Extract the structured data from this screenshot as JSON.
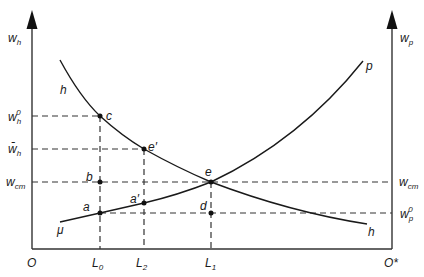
{
  "diagram": {
    "type": "two-sector labor market (hourly and paid sectors)",
    "colors": {
      "ink": "#1a1a1a",
      "axis": "#333333",
      "background": "#ffffff"
    },
    "axes": {
      "left": {
        "label": "w",
        "label_sub": "h",
        "origin": "O"
      },
      "right": {
        "label": "w",
        "label_sub": "p",
        "origin": "O*"
      }
    },
    "y_levels": [
      {
        "id": "wh0",
        "label": "w",
        "sub": "h",
        "sup": "0",
        "side": "left"
      },
      {
        "id": "wh_bar",
        "label": "w̄",
        "sub": "h",
        "side": "left"
      },
      {
        "id": "wcm_left",
        "label": "w",
        "sub": "cm",
        "side": "left"
      },
      {
        "id": "wcm_right",
        "label": "w",
        "sub": "cm",
        "side": "right"
      },
      {
        "id": "wp0",
        "label": "w",
        "sub": "p",
        "sup": "0",
        "side": "right"
      }
    ],
    "x_levels": [
      {
        "id": "L0",
        "label": "L",
        "sub": "0"
      },
      {
        "id": "L2",
        "label": "L",
        "sub": "2"
      },
      {
        "id": "L1",
        "label": "L",
        "sub": "1"
      }
    ],
    "curves": [
      {
        "id": "h",
        "label": "h",
        "end_label": "h",
        "shape": "downward-sloping convex"
      },
      {
        "id": "p",
        "label": "p",
        "start_label": "μ",
        "shape": "upward-sloping convex"
      }
    ],
    "points": [
      {
        "id": "c",
        "label": "c"
      },
      {
        "id": "e_prime",
        "label": "e′"
      },
      {
        "id": "e",
        "label": "e"
      },
      {
        "id": "b",
        "label": "b"
      },
      {
        "id": "a",
        "label": "a"
      },
      {
        "id": "a_prime",
        "label": "a′"
      },
      {
        "id": "d",
        "label": "d"
      }
    ]
  }
}
